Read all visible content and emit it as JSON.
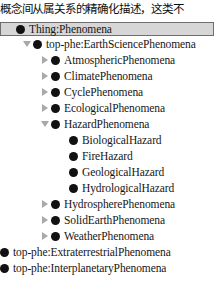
{
  "caption": {
    "text": "概念间从属关系的精确化描述，这类不"
  },
  "colors": {
    "background": "#ffffff",
    "selection_fill": "#d6d6d6",
    "selection_border": "#6e6e6e",
    "bullet": "#111111",
    "twisty": "#a8a8a8",
    "text": "#161616"
  },
  "tree": {
    "name": "ontology-class-hierarchy",
    "rows": [
      {
        "label": "Thing:Phenomena",
        "depth": 0,
        "twisty": "none",
        "selected": true,
        "icon": "owl-class-icon"
      },
      {
        "label": "top-phe:EarthSciencePhenomena",
        "depth": 1,
        "twisty": "expanded",
        "selected": false,
        "icon": "owl-class-icon"
      },
      {
        "label": "AtmosphericPhenomena",
        "depth": 2,
        "twisty": "collapsed",
        "selected": false,
        "icon": "owl-class-icon"
      },
      {
        "label": "ClimatePhenomena",
        "depth": 2,
        "twisty": "collapsed",
        "selected": false,
        "icon": "owl-class-icon"
      },
      {
        "label": "CyclePhenomena",
        "depth": 2,
        "twisty": "collapsed",
        "selected": false,
        "icon": "owl-class-icon"
      },
      {
        "label": "EcologicalPhenomena",
        "depth": 2,
        "twisty": "collapsed",
        "selected": false,
        "icon": "owl-class-icon"
      },
      {
        "label": "HazardPhenomena",
        "depth": 2,
        "twisty": "expanded",
        "selected": false,
        "icon": "owl-class-icon"
      },
      {
        "label": "BiologicalHazard",
        "depth": 3,
        "twisty": "none",
        "selected": false,
        "icon": "owl-class-icon"
      },
      {
        "label": "FireHazard",
        "depth": 3,
        "twisty": "none",
        "selected": false,
        "icon": "owl-class-icon"
      },
      {
        "label": "GeologicalHazard",
        "depth": 3,
        "twisty": "none",
        "selected": false,
        "icon": "owl-class-icon"
      },
      {
        "label": "HydrologicalHazard",
        "depth": 3,
        "twisty": "none",
        "selected": false,
        "icon": "owl-class-icon"
      },
      {
        "label": "HydrospherePhenomena",
        "depth": 2,
        "twisty": "collapsed",
        "selected": false,
        "icon": "owl-class-icon"
      },
      {
        "label": "SolidEarthPhenomena",
        "depth": 2,
        "twisty": "collapsed",
        "selected": false,
        "icon": "owl-class-icon"
      },
      {
        "label": "WeatherPhenomena",
        "depth": 2,
        "twisty": "collapsed",
        "selected": false,
        "icon": "owl-class-icon"
      },
      {
        "label": "top-phe:ExtraterrestrialPhenomena",
        "depth": -1,
        "twisty": "none",
        "selected": false,
        "icon": "owl-class-icon"
      },
      {
        "label": "top-phe:InterplanetaryPhenomena",
        "depth": -1,
        "twisty": "none",
        "selected": false,
        "icon": "owl-class-icon"
      }
    ]
  }
}
